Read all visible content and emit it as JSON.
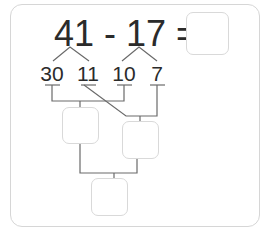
{
  "equation": {
    "minuend": "41",
    "operator": "-",
    "subtrahend": "17",
    "equals": "=",
    "display": "41 - 17 ="
  },
  "decomposition": {
    "parts": [
      "30",
      "11",
      "10",
      "7"
    ]
  },
  "answer_boxes": {
    "final_answer": "",
    "box_30_minus_10": "",
    "box_11_minus_7": "",
    "box_sum": ""
  }
}
